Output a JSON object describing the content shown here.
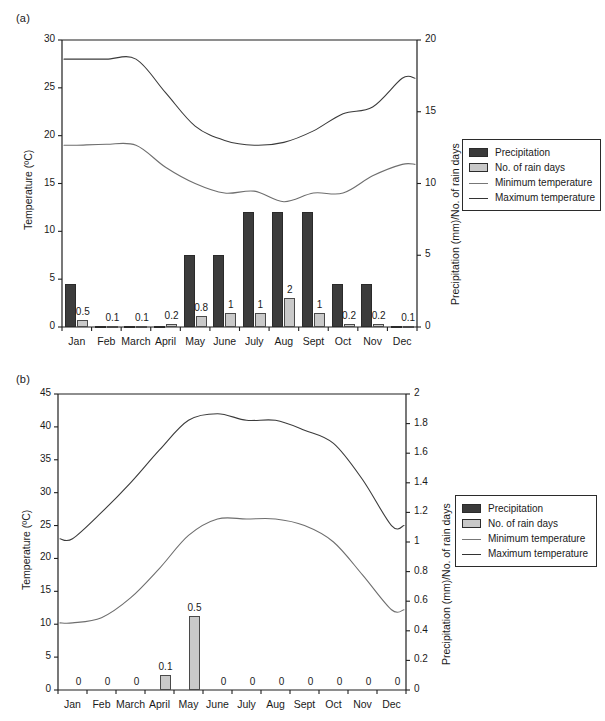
{
  "figure": {
    "panel_a_label": "(a)",
    "panel_b_label": "(b)"
  },
  "legend": {
    "items": [
      {
        "label": "Precipitation",
        "type": "swatch-dark",
        "color": "#3a3a3a"
      },
      {
        "label": "No. of rain days",
        "type": "swatch-light",
        "color": "#c8c8c8"
      },
      {
        "label": "Minimum temperature",
        "type": "line-min",
        "color": "#777777"
      },
      {
        "label": "Maximum temperature",
        "type": "line-max",
        "color": "#333333"
      }
    ]
  },
  "chart_data": [
    {
      "id": "panel-a",
      "type": "bar",
      "title": "(a)",
      "xlabel": "",
      "ylabel": "Temperature (ºC)",
      "y2label": "Precipitation (mm)/No. of rain days",
      "categories": [
        "Jan",
        "Feb",
        "March",
        "April",
        "May",
        "June",
        "July",
        "Aug",
        "Sept",
        "Oct",
        "Nov",
        "Dec"
      ],
      "ylim": [
        0,
        30
      ],
      "yticks": [
        0,
        5,
        10,
        15,
        20,
        25,
        30
      ],
      "y2lim": [
        0,
        20
      ],
      "y2ticks": [
        0,
        5,
        10,
        15,
        20
      ],
      "grid": false,
      "legend_position": "right",
      "series": [
        {
          "name": "Precipitation",
          "kind": "bar",
          "axis": "y2",
          "unit": "mm",
          "values": [
            3.0,
            0.1,
            0.1,
            0.05,
            5.0,
            5.0,
            8.0,
            8.0,
            8.0,
            3.0,
            3.0,
            0.1
          ]
        },
        {
          "name": "No. of rain days",
          "kind": "bar",
          "axis": "y2",
          "unit": "days",
          "values": [
            0.5,
            0.1,
            0.1,
            0.2,
            0.8,
            1.0,
            1.0,
            2.0,
            1.0,
            0.2,
            0.2,
            0.1
          ],
          "data_labels": [
            "0.5",
            "0.1",
            "0.1",
            "0.2",
            "0.8",
            "1",
            "1",
            "2",
            "1",
            "0.2",
            "0.2",
            "0.1"
          ]
        },
        {
          "name": "Maximum temperature",
          "kind": "line",
          "axis": "y",
          "unit": "ºC",
          "values": [
            28.0,
            28.0,
            28.0,
            24.5,
            21.0,
            19.5,
            19.0,
            19.3,
            20.5,
            22.3,
            23.0,
            26.0
          ]
        },
        {
          "name": "Minimum temperature",
          "kind": "line",
          "axis": "y",
          "unit": "ºC",
          "values": [
            19.0,
            19.1,
            19.0,
            16.7,
            15.0,
            14.0,
            14.2,
            13.1,
            14.0,
            14.0,
            15.8,
            17.0
          ]
        }
      ]
    },
    {
      "id": "panel-b",
      "type": "bar",
      "title": "(b)",
      "xlabel": "",
      "ylabel": "Temperature (ºC)",
      "y2label": "Precipitation (mm)/No. of rain days",
      "categories": [
        "Jan",
        "Feb",
        "March",
        "April",
        "May",
        "June",
        "July",
        "Aug",
        "Sept",
        "Oct",
        "Nov",
        "Dec"
      ],
      "ylim": [
        0,
        45
      ],
      "yticks": [
        0,
        5,
        10,
        15,
        20,
        25,
        30,
        35,
        40,
        45
      ],
      "y2lim": [
        0,
        2
      ],
      "y2ticks": [
        0,
        0.2,
        0.4,
        0.6,
        0.8,
        1,
        1.2,
        1.4,
        1.6,
        1.8,
        2
      ],
      "grid": false,
      "legend_position": "right",
      "series": [
        {
          "name": "Precipitation",
          "kind": "bar",
          "axis": "y2",
          "unit": "mm",
          "values": [
            0,
            0,
            0,
            0,
            0,
            0,
            0,
            0,
            0,
            0,
            0,
            0
          ]
        },
        {
          "name": "No. of rain days",
          "kind": "bar",
          "axis": "y2",
          "unit": "days",
          "values": [
            0,
            0,
            0,
            0.1,
            0.5,
            0,
            0,
            0,
            0,
            0,
            0,
            0
          ],
          "data_labels": [
            "0",
            "0",
            "0",
            "0.1",
            "0.5",
            "0",
            "0",
            "0",
            "0",
            "0",
            "0",
            "0"
          ]
        },
        {
          "name": "Maximum temperature",
          "kind": "line",
          "axis": "y",
          "unit": "ºC",
          "values": [
            23.0,
            27.0,
            31.5,
            36.5,
            41.0,
            42.0,
            41.0,
            41.0,
            39.5,
            37.5,
            32.0,
            25.0
          ]
        },
        {
          "name": "Minimum temperature",
          "kind": "line",
          "axis": "y",
          "unit": "ºC",
          "values": [
            10.2,
            11.0,
            14.0,
            18.5,
            23.5,
            26.0,
            26.0,
            26.0,
            25.0,
            22.5,
            17.5,
            12.2
          ]
        }
      ]
    }
  ]
}
